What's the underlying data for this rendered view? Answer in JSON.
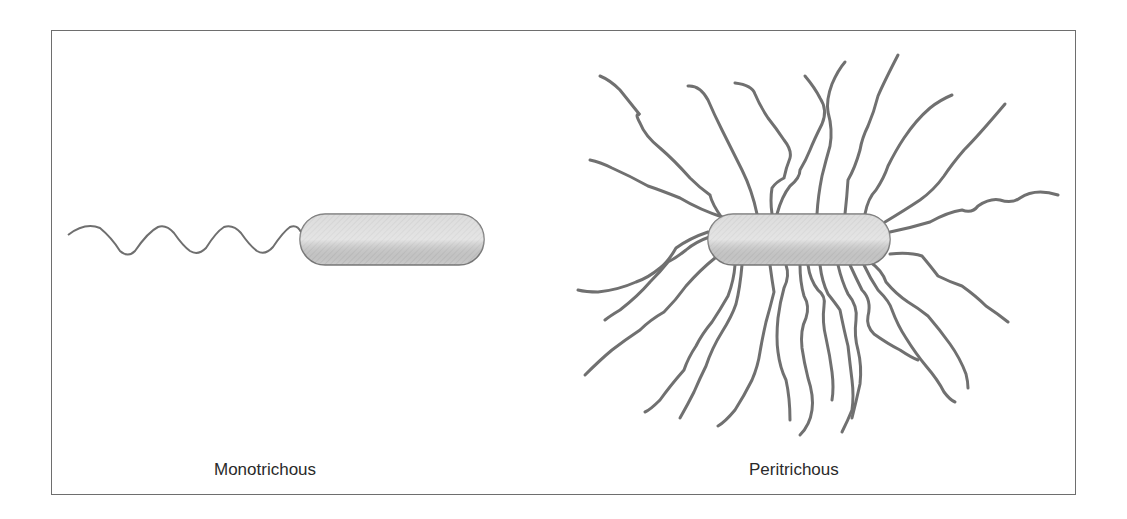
{
  "figure": {
    "panels": [
      {
        "id": "monotrichous",
        "label": "Monotrichous",
        "flagella_count": 1
      },
      {
        "id": "peritrichous",
        "label": "Peritrichous",
        "flagella_count": 28
      }
    ],
    "colors": {
      "border": "#6e6e6e",
      "flagellum": "#6f6f6f",
      "cell_fill": "#d4d4d4",
      "cell_stroke": "#7a7a7a",
      "text": "#2a2a2a"
    }
  }
}
